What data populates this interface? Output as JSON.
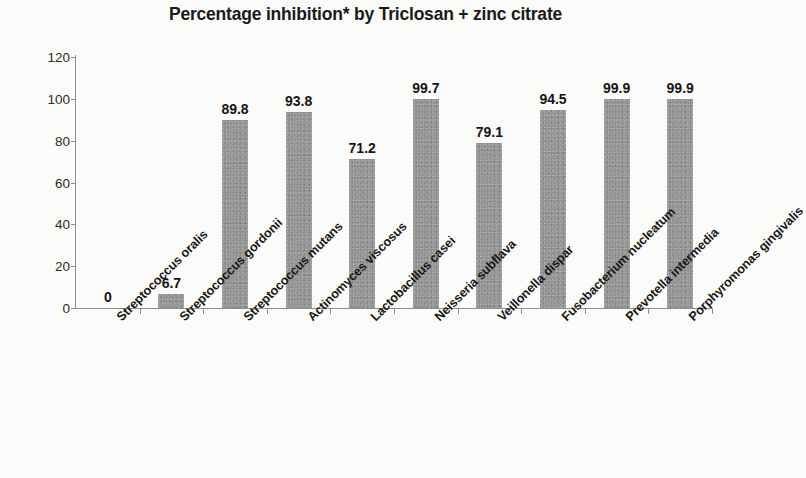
{
  "chart_data": {
    "type": "bar",
    "title": "Percentage inhibition* by Triclosan + zinc citrate",
    "xlabel": "",
    "ylabel": "",
    "ylim": [
      0,
      120
    ],
    "y_ticks": [
      0,
      20,
      40,
      60,
      80,
      100,
      120
    ],
    "grid": false,
    "legend": "none",
    "bar_color": "#959595",
    "categories": [
      "Streptococcus oralis",
      "Streptococcus gordonii",
      "Streptococcus mutans",
      "Actinomyces viscosus",
      "Lactobacillus casei",
      "Neisseria subflava",
      "Veillonella dispar",
      "Fusobacterium nucleatum",
      "Prevotella intermedia",
      "Porphyromonas gingivalis"
    ],
    "values": [
      0,
      6.7,
      89.8,
      93.8,
      71.2,
      99.7,
      79.1,
      94.5,
      99.9,
      99.9
    ],
    "value_labels": [
      "0",
      "6.7",
      "89.8",
      "93.8",
      "71.2",
      "99.7",
      "79.1",
      "94.5",
      "99.9",
      "99.9"
    ],
    "y_tick_labels": [
      "0",
      "20",
      "40",
      "60",
      "80",
      "100",
      "120"
    ]
  }
}
